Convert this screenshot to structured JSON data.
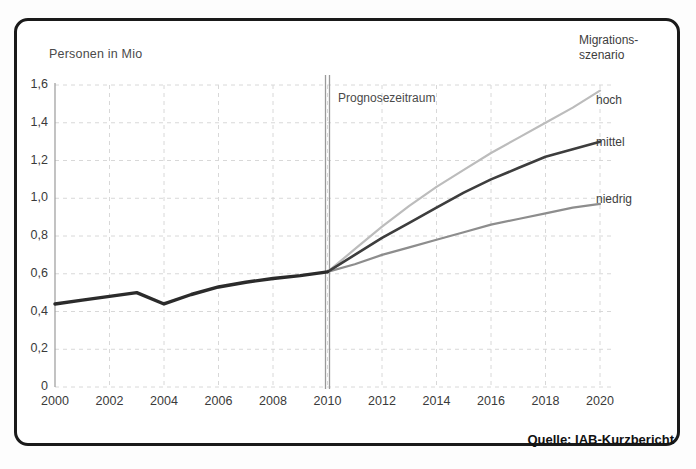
{
  "figure": {
    "y_axis_title": "Personen in Mio",
    "annotation": "Prognosezeitraum",
    "source": "Quelle: IAB-Kurzbericht",
    "legend_title_line1": "Migrations-",
    "legend_title_line2": "szenario",
    "legend": {
      "hoch": "hoch",
      "mittel": "mittel",
      "niedrig": "niedrig"
    }
  },
  "chart_data": {
    "type": "line",
    "title": "",
    "subtitle": "",
    "xlabel": "",
    "ylabel": "Personen in Mio",
    "xlim": [
      2000,
      2020
    ],
    "ylim": [
      0,
      1.6
    ],
    "grid": true,
    "legend_position": "right",
    "y_ticks": [
      "0",
      "0,2",
      "0,4",
      "0,6",
      "0,8",
      "1,0",
      "1,2",
      "1,4",
      "1,6"
    ],
    "y_tick_values": [
      0,
      0.2,
      0.4,
      0.6,
      0.8,
      1.0,
      1.2,
      1.4,
      1.6
    ],
    "x_ticks": [
      "2000",
      "2002",
      "2004",
      "2006",
      "2008",
      "2010",
      "2012",
      "2014",
      "2016",
      "2018",
      "2020"
    ],
    "x_tick_values": [
      2000,
      2002,
      2004,
      2006,
      2008,
      2010,
      2012,
      2014,
      2016,
      2018,
      2020
    ],
    "forecast_start": 2010,
    "forecast_marker_label": "Prognosezeitraum",
    "colors": {
      "history": "#2b2b2b",
      "hoch": "#bcbcbc",
      "mittel": "#3d3d3d",
      "niedrig": "#8d8d8d",
      "grid": "#d8d8d8",
      "axis": "#2b2b2b",
      "frame": "#1a1a1a"
    },
    "series": [
      {
        "name": "Ist-Werte",
        "segment": "history",
        "x": [
          2000,
          2001,
          2002,
          2003,
          2004,
          2005,
          2006,
          2007,
          2008,
          2009,
          2010
        ],
        "values": [
          0.44,
          0.46,
          0.48,
          0.5,
          0.44,
          0.49,
          0.53,
          0.555,
          0.575,
          0.59,
          0.61
        ]
      },
      {
        "name": "hoch",
        "segment": "forecast",
        "x": [
          2010,
          2011,
          2012,
          2013,
          2014,
          2015,
          2016,
          2017,
          2018,
          2019,
          2020
        ],
        "values": [
          0.61,
          0.73,
          0.85,
          0.96,
          1.06,
          1.15,
          1.24,
          1.32,
          1.4,
          1.48,
          1.57
        ]
      },
      {
        "name": "mittel",
        "segment": "forecast",
        "x": [
          2010,
          2011,
          2012,
          2013,
          2014,
          2015,
          2016,
          2017,
          2018,
          2019,
          2020
        ],
        "values": [
          0.61,
          0.7,
          0.79,
          0.87,
          0.95,
          1.03,
          1.1,
          1.16,
          1.22,
          1.26,
          1.3
        ]
      },
      {
        "name": "niedrig",
        "segment": "forecast",
        "x": [
          2010,
          2011,
          2012,
          2013,
          2014,
          2015,
          2016,
          2017,
          2018,
          2019,
          2020
        ],
        "values": [
          0.61,
          0.65,
          0.7,
          0.74,
          0.78,
          0.82,
          0.86,
          0.89,
          0.92,
          0.95,
          0.97
        ]
      }
    ]
  }
}
